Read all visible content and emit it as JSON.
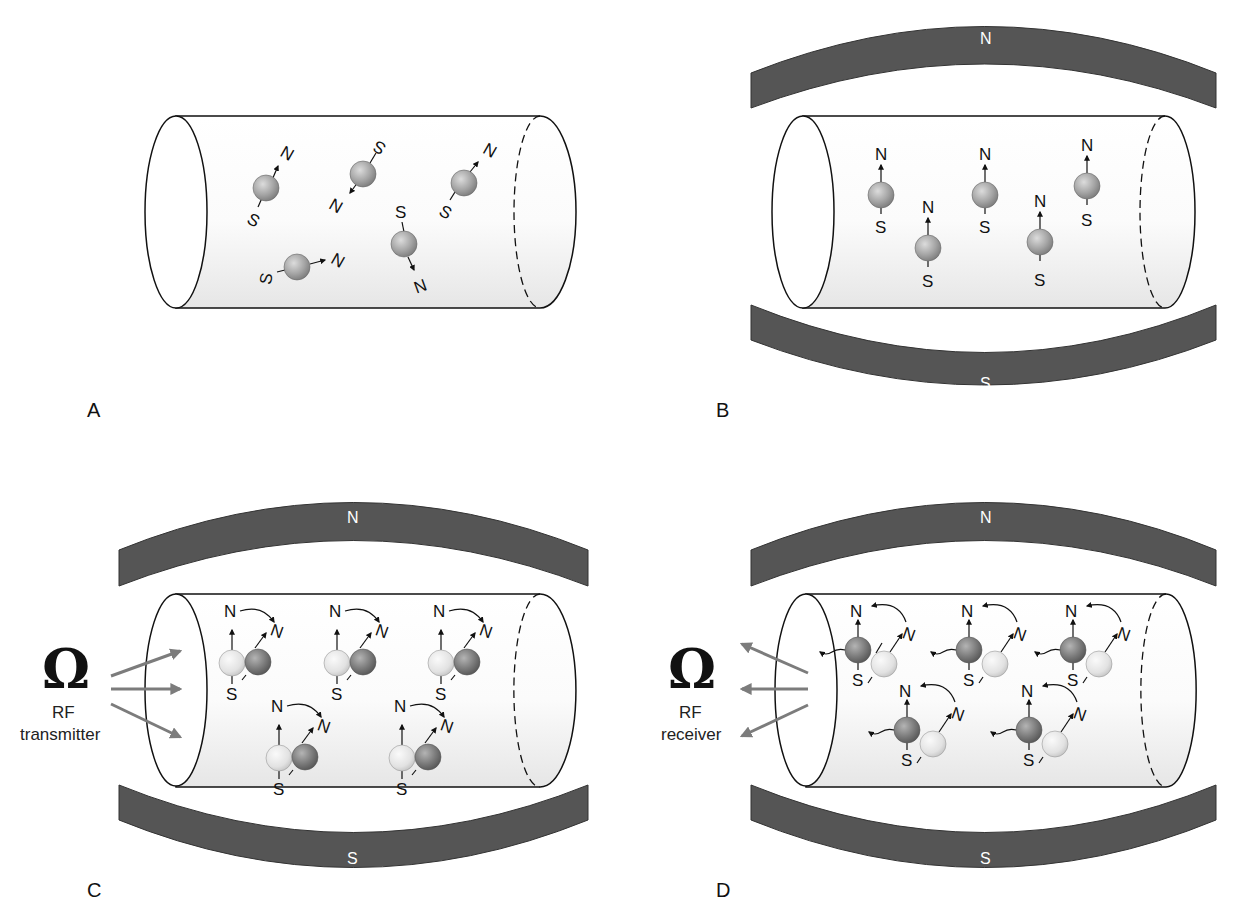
{
  "colors": {
    "magnet": "#555555",
    "proton_normal": "#a8a8a8",
    "proton_light": "#e6e6e6",
    "proton_dark": "#7e7e7e",
    "rf_arrow": "#808080",
    "outline": "#111111"
  },
  "panels": [
    {
      "id": "A",
      "letter": "A",
      "description": "Protons randomly oriented, no external magnetic field",
      "has_magnet": false,
      "protons": [
        {
          "pole_n": "N",
          "pole_s": "S"
        },
        {
          "pole_n": "N",
          "pole_s": "S"
        },
        {
          "pole_n": "N",
          "pole_s": "S"
        },
        {
          "pole_n": "N",
          "pole_s": "S"
        },
        {
          "pole_n": "N",
          "pole_s": "S"
        }
      ]
    },
    {
      "id": "B",
      "letter": "B",
      "description": "Protons aligned with the external magnetic field",
      "has_magnet": true,
      "magnet_top": "N",
      "magnet_bottom": "S",
      "protons": [
        {
          "pole_n": "N",
          "pole_s": "S"
        },
        {
          "pole_n": "N",
          "pole_s": "S"
        },
        {
          "pole_n": "N",
          "pole_s": "S"
        },
        {
          "pole_n": "N",
          "pole_s": "S"
        },
        {
          "pole_n": "N",
          "pole_s": "S"
        }
      ]
    },
    {
      "id": "C",
      "letter": "C",
      "description": "RF pulse tips protons out of alignment",
      "has_magnet": true,
      "magnet_top": "N",
      "magnet_bottom": "S",
      "rf_device": {
        "line1": "RF",
        "line2": "transmitter",
        "symbol": "Ω"
      },
      "protons": [
        {
          "pole_n": "N",
          "pole_s": "S",
          "tipped_n": "N"
        },
        {
          "pole_n": "N",
          "pole_s": "S",
          "tipped_n": "N"
        },
        {
          "pole_n": "N",
          "pole_s": "S",
          "tipped_n": "N"
        },
        {
          "pole_n": "N",
          "pole_s": "S",
          "tipped_n": "N"
        },
        {
          "pole_n": "N",
          "pole_s": "S",
          "tipped_n": "N"
        }
      ]
    },
    {
      "id": "D",
      "letter": "D",
      "description": "Protons relax back, emitting signal detected by RF receiver",
      "has_magnet": true,
      "magnet_top": "N",
      "magnet_bottom": "S",
      "rf_device": {
        "line1": "RF",
        "line2": "receiver",
        "symbol": "Ω"
      },
      "protons": [
        {
          "pole_n": "N",
          "pole_s": "S",
          "tipped_n": "N"
        },
        {
          "pole_n": "N",
          "pole_s": "S",
          "tipped_n": "N"
        },
        {
          "pole_n": "N",
          "pole_s": "S",
          "tipped_n": "N"
        },
        {
          "pole_n": "N",
          "pole_s": "S",
          "tipped_n": "N"
        },
        {
          "pole_n": "N",
          "pole_s": "S",
          "tipped_n": "N"
        }
      ]
    }
  ]
}
